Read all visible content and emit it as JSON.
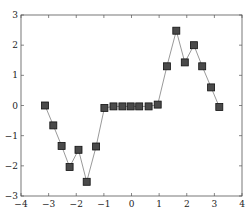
{
  "chart_data": {
    "type": "line",
    "title": "",
    "xlabel": "",
    "ylabel": "",
    "xlim": [
      -4,
      4
    ],
    "ylim": [
      -3,
      3
    ],
    "grid": false,
    "legend": null,
    "x_ticks": [
      -4,
      -3,
      -2,
      -1,
      0,
      1,
      2,
      3,
      4
    ],
    "x_tick_labels": [
      "−4",
      "−3",
      "−2",
      "−1",
      "0",
      "1",
      "2",
      "3",
      "4"
    ],
    "y_ticks": [
      -3,
      -2,
      -1,
      0,
      1,
      2,
      3
    ],
    "y_tick_labels": [
      "−3",
      "−2",
      "−1",
      "0",
      "1",
      "2",
      "3"
    ],
    "series": [
      {
        "name": "series-1",
        "marker": "square",
        "line_color": "#9a9a9a",
        "marker_fill": "#4a4a4a",
        "marker_edge": "#111111",
        "x": [
          -3.13,
          -2.83,
          -2.53,
          -2.24,
          -1.92,
          -1.62,
          -1.28,
          -0.98,
          -0.65,
          -0.33,
          -0.03,
          0.28,
          0.62,
          0.95,
          1.28,
          1.62,
          1.93,
          2.26,
          2.56,
          2.88,
          3.18
        ],
        "y": [
          0.0,
          -0.66,
          -1.34,
          -2.04,
          -1.47,
          -2.53,
          -1.36,
          -0.08,
          -0.03,
          -0.03,
          -0.03,
          -0.03,
          -0.03,
          0.03,
          1.3,
          2.48,
          1.43,
          2.0,
          1.3,
          0.6,
          -0.05
        ]
      }
    ]
  }
}
